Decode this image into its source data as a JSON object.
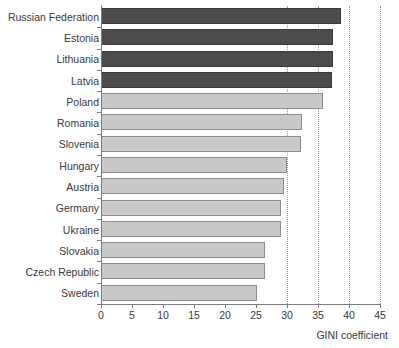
{
  "chart_data": {
    "type": "bar",
    "orientation": "horizontal",
    "title": "",
    "xlabel": "GINI coefficient",
    "ylabel": "",
    "xlim": [
      0,
      45
    ],
    "xticks": [
      0,
      5,
      10,
      15,
      20,
      25,
      30,
      35,
      40,
      45
    ],
    "grid": "vertical dotted gridlines at 30, 35, 40, 45",
    "gridlines": [
      30,
      35,
      40,
      45
    ],
    "legend": "none",
    "categories": [
      "Russian Federation",
      "Estonia",
      "Lithuania",
      "Latvia",
      "Poland",
      "Romania",
      "Slovenia",
      "Hungary",
      "Austria",
      "Germany",
      "Ukraine",
      "Slovakia",
      "Czech Republic",
      "Sweden"
    ],
    "values": [
      38.7,
      37.4,
      37.4,
      37.3,
      35.8,
      32.4,
      32.3,
      30.0,
      29.5,
      29.0,
      29.0,
      26.5,
      26.5,
      25.1
    ],
    "bar_styles": [
      "dark",
      "dark",
      "dark",
      "dark",
      "light",
      "light",
      "light",
      "light",
      "light",
      "light",
      "light",
      "light",
      "light",
      "light"
    ],
    "colors": {
      "dark_bar": "#4c4c4c",
      "light_bar": "#c9c9c9",
      "bar_border": "#7a7a7a",
      "axis": "#7d7d7d",
      "gridline": "#9a9a9a",
      "text": "#3a3a3a",
      "background": "#ffffff"
    }
  }
}
